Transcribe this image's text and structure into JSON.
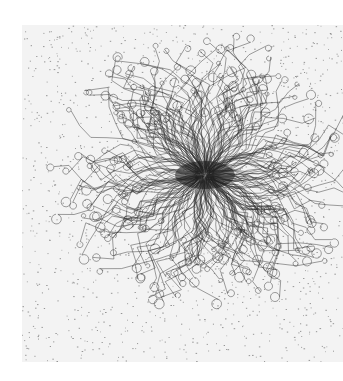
{
  "image": {
    "subject": "ink drawing of radiating filaments forming a dense burst",
    "background": "#ffffff",
    "paper_color": "#f3f3f3",
    "ink_color": "#2a2a2a",
    "center": [
      205,
      175
    ],
    "radius_x": 150,
    "radius_y": 135,
    "strand_count": 260,
    "speckle_count": 1400
  }
}
